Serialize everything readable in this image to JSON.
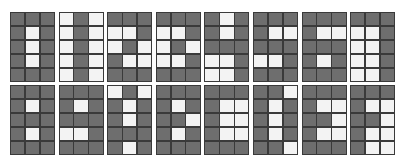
{
  "colors": {
    "filled": "#6e6e6e",
    "empty": "#f3f3f3",
    "border": "#3a3a3a"
  },
  "grid": {
    "rows": 5,
    "cols": 3
  },
  "glyphs": [
    [
      "DDD",
      "DWD",
      "DWD",
      "DWD",
      "DDD"
    ],
    [
      "WDW",
      "WDW",
      "WDW",
      "WDW",
      "WDW"
    ],
    [
      "DDD",
      "WWD",
      "WDW",
      "DWW",
      "DDD"
    ],
    [
      "DDD",
      "WWD",
      "WDW",
      "WWD",
      "DDD"
    ],
    [
      "DWD",
      "DWD",
      "DDD",
      "WWD",
      "WWD"
    ],
    [
      "DDD",
      "DWW",
      "DDD",
      "WWD",
      "DDD"
    ],
    [
      "DDD",
      "DWW",
      "DDD",
      "DWD",
      "DDD"
    ],
    [
      "DDD",
      "WWD",
      "WWD",
      "WWD",
      "WWD"
    ],
    [
      "DDD",
      "DWD",
      "DDD",
      "DWD",
      "DDD"
    ],
    [
      "DDD",
      "DWD",
      "DDD",
      "WWD",
      "DDD"
    ],
    [
      "WDW",
      "DWD",
      "DWD",
      "DDD",
      "DWD"
    ],
    [
      "DDD",
      "DWD",
      "DDW",
      "DWD",
      "DDD"
    ],
    [
      "DDD",
      "DWW",
      "DWW",
      "DWW",
      "DDD"
    ],
    [
      "DDW",
      "DWD",
      "DWD",
      "DWD",
      "DDW"
    ],
    [
      "DDD",
      "DWW",
      "DDW",
      "DWW",
      "DDD"
    ],
    [
      "DDD",
      "DWW",
      "DDW",
      "DWW",
      "DWW"
    ]
  ]
}
